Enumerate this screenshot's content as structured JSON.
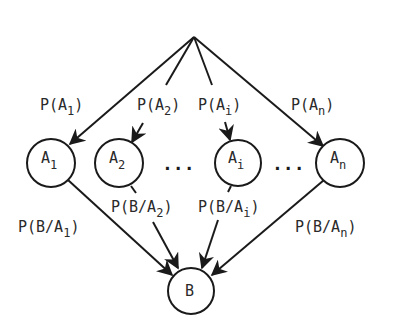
{
  "diagram": {
    "type": "probability-tree",
    "root": {
      "label": ""
    },
    "hypotheses": [
      {
        "id": "A1",
        "base": "A",
        "sub": "1",
        "prior": {
          "pre": "P(A",
          "sub": "1",
          "post": ")"
        },
        "likelihood": {
          "pre": "P(B/A",
          "sub": "1",
          "post": ")"
        }
      },
      {
        "id": "A2",
        "base": "A",
        "sub": "2",
        "prior": {
          "pre": "P(A",
          "sub": "2",
          "post": ")"
        },
        "likelihood": {
          "pre": "P(B/A",
          "sub": "2",
          "post": ")"
        }
      },
      {
        "id": "Ai",
        "base": "A",
        "sub": "i",
        "prior": {
          "pre": "P(A",
          "sub": "i",
          "post": ")"
        },
        "likelihood": {
          "pre": "P(B/A",
          "sub": "i",
          "post": ")"
        }
      },
      {
        "id": "An",
        "base": "A",
        "sub": "n",
        "prior": {
          "pre": "P(A",
          "sub": "n",
          "post": ")"
        },
        "likelihood": {
          "pre": "P(B/A",
          "sub": "n",
          "post": ")"
        }
      }
    ],
    "ellipsis": [
      "...",
      "..."
    ],
    "target": {
      "label": "B"
    }
  }
}
